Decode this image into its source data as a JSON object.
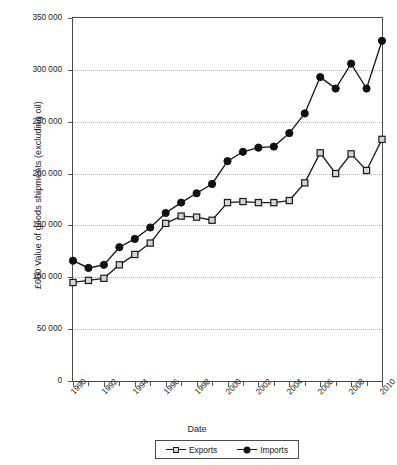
{
  "chart_data": {
    "type": "line",
    "title": "",
    "xlabel": "Date",
    "ylabel": "£000 Value of goods shipments (excluding oil)",
    "x": [
      1990,
      1991,
      1992,
      1993,
      1994,
      1995,
      1996,
      1997,
      1998,
      1999,
      2000,
      2001,
      2002,
      2003,
      2004,
      2005,
      2006,
      2007,
      2008,
      2009,
      2010
    ],
    "xlim": [
      1990,
      2010
    ],
    "ylim": [
      0,
      350000
    ],
    "yticks": [
      0,
      50000,
      100000,
      150000,
      200000,
      250000,
      300000,
      350000
    ],
    "ytick_labels": [
      "0",
      "50 000",
      "100 000",
      "150 000",
      "200 000",
      "250 000",
      "300 000",
      "350 000"
    ],
    "xtick_values": [
      1990,
      1992,
      1994,
      1996,
      1998,
      2000,
      2002,
      2004,
      2006,
      2008,
      2010
    ],
    "xtick_labels": [
      "1990",
      "1992",
      "1994",
      "1996",
      "1998",
      "2000",
      "2002",
      "2004",
      "2006",
      "2008",
      "2010"
    ],
    "xtick_minor_values": [
      1991,
      1993,
      1995,
      1997,
      1999,
      2001,
      2003,
      2005,
      2007,
      2009
    ],
    "grid": true,
    "grid_axis": "y",
    "legend_position": "bottom",
    "series": [
      {
        "name": "Exports",
        "marker": "open-square",
        "color": "#1a1a1a",
        "marker_fill": "#d4d4d4",
        "values": [
          95000,
          97000,
          99000,
          112000,
          122000,
          133000,
          152000,
          159000,
          158000,
          155000,
          172000,
          173000,
          172000,
          172000,
          174000,
          191000,
          220000,
          200000,
          219000,
          203000,
          233000
        ]
      },
      {
        "name": "Imports",
        "marker": "filled-circle",
        "color": "#111111",
        "marker_fill": "#111111",
        "values": [
          116000,
          109000,
          112000,
          129000,
          137000,
          148000,
          162000,
          172000,
          181000,
          190000,
          212000,
          221000,
          225000,
          226000,
          239000,
          258000,
          293000,
          282000,
          306000,
          282000,
          328000
        ]
      }
    ]
  },
  "axes": {
    "ylabel": "£000 Value of goods shipments (excluding oil)",
    "xlabel": "Date"
  },
  "legend": {
    "items": [
      {
        "label": "Exports"
      },
      {
        "label": "Imports"
      }
    ]
  }
}
